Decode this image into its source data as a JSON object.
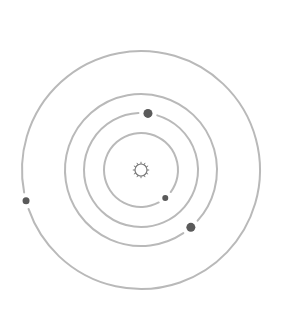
{
  "diagram": {
    "title": "",
    "colors": {
      "background": "#ffffff",
      "orbit": "#b9b9b9",
      "planet": "#5a5a5a",
      "sun": "#7a7a7a"
    },
    "center": {
      "x": 141,
      "y": 170
    },
    "sun": {
      "icon": "sun-icon",
      "radius": 8
    },
    "orbits": [
      {
        "name": "orbit-1",
        "radius": 37,
        "planet": {
          "angle_deg": 49,
          "size": 3
        }
      },
      {
        "name": "orbit-2",
        "radius": 57,
        "planet": {
          "angle_deg": -83,
          "size": 4.5
        }
      },
      {
        "name": "orbit-3",
        "radius": 76,
        "planet": {
          "angle_deg": 49,
          "size": 4.5
        }
      },
      {
        "name": "orbit-4",
        "radius": 119,
        "planet": {
          "angle_deg": 165,
          "size": 3.5
        }
      }
    ]
  }
}
